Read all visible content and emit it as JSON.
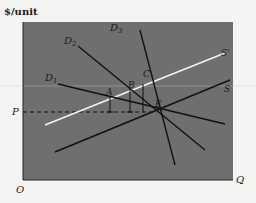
{
  "diagram": {
    "y_axis_label": "$/unit",
    "x_axis_label": "Q",
    "origin_label": "O",
    "price_label": "P",
    "colors": {
      "panel": "#6f6f6f",
      "line": "#111111",
      "supply_shifted": "#f2f2f2",
      "background": "#f4f4f2"
    },
    "curves": {
      "d1": {
        "label": "D",
        "sub": "1"
      },
      "d2": {
        "label": "D",
        "sub": "2"
      },
      "d3": {
        "label": "D",
        "sub": "3"
      },
      "s": {
        "label": "S"
      },
      "s_prime": {
        "label": "S'"
      }
    },
    "points": {
      "a": "A",
      "b": "B",
      "c": "C",
      "e": "E"
    }
  }
}
